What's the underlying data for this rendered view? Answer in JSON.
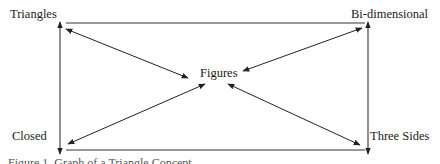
{
  "diagram": {
    "nodes": {
      "top_left": "Triangles",
      "top_right": "Bi-dimensional",
      "center": "Figures",
      "bottom_left": "Closed",
      "bottom_right": "Three Sides"
    },
    "edges": [
      {
        "from": "Triangles",
        "to": "Figures",
        "type": "bidirectional"
      },
      {
        "from": "Bi-dimensional",
        "to": "Figures",
        "type": "bidirectional"
      },
      {
        "from": "Closed",
        "to": "Figures",
        "type": "bidirectional"
      },
      {
        "from": "Three Sides",
        "to": "Figures",
        "type": "bidirectional"
      },
      {
        "from": "Triangles",
        "to": "Closed",
        "type": "bidirectional"
      },
      {
        "from": "Bi-dimensional",
        "to": "Three Sides",
        "type": "bidirectional"
      }
    ],
    "caption": "Figure 1. Graph of a Triangle Concept",
    "line_color": "#222222"
  }
}
